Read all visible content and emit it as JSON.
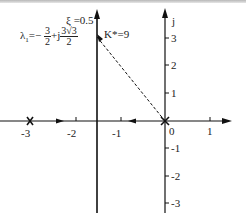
{
  "figure": {
    "type": "root-locus",
    "real_axis": {
      "ticks": [
        "-3",
        "-2",
        "-1",
        "0",
        "1"
      ]
    },
    "imag_axis": {
      "label": "j",
      "ticks": [
        "3",
        "2",
        "1",
        "-1",
        "-2",
        "-3"
      ]
    },
    "poles": [
      {
        "name": "pole-at-minus-3",
        "sigma": -3,
        "omega": 0
      },
      {
        "name": "pole-at-origin",
        "sigma": 0,
        "omega": 0
      }
    ],
    "breakaway_asymptote": {
      "sigma": -1.5
    },
    "annotations": {
      "damping": "ξ =0.5",
      "lambda_prefix": "λ",
      "lambda_sub": "1",
      "lambda_eq": "=−",
      "frac1_num": "3",
      "frac1_den": "2",
      "plus_j": "+j",
      "frac2_num": "3√3",
      "frac2_den": "2",
      "gain": "K*=9"
    },
    "colors": {
      "line": "#111111",
      "text": "#222222"
    }
  }
}
